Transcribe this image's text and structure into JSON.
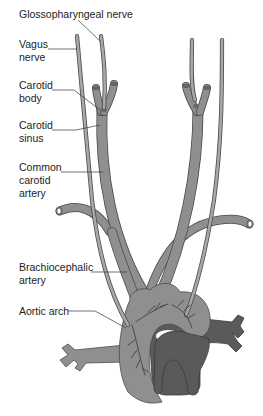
{
  "diagram": {
    "labels": [
      {
        "id": "glossopharyngeal-nerve",
        "text": "Glossopharyngeal nerve"
      },
      {
        "id": "vagus-nerve",
        "text": "Vagus\nnerve"
      },
      {
        "id": "carotid-body",
        "text": "Carotid\nbody"
      },
      {
        "id": "carotid-sinus",
        "text": "Carotid\nsinus"
      },
      {
        "id": "common-carotid-artery",
        "text": "Common\ncarotid\nartery"
      },
      {
        "id": "brachiocephalic-artery",
        "text": "Brachiocephalic\nartery"
      },
      {
        "id": "aortic-arch",
        "text": "Aortic arch"
      }
    ],
    "colors": {
      "artery_fill": "#8f8f8f",
      "pulmonary_fill": "#5a5a5a",
      "outline": "#4a4a4a",
      "nerve_fill": "#a8a8a8",
      "label_text": "#222222",
      "background": "#ffffff"
    }
  }
}
